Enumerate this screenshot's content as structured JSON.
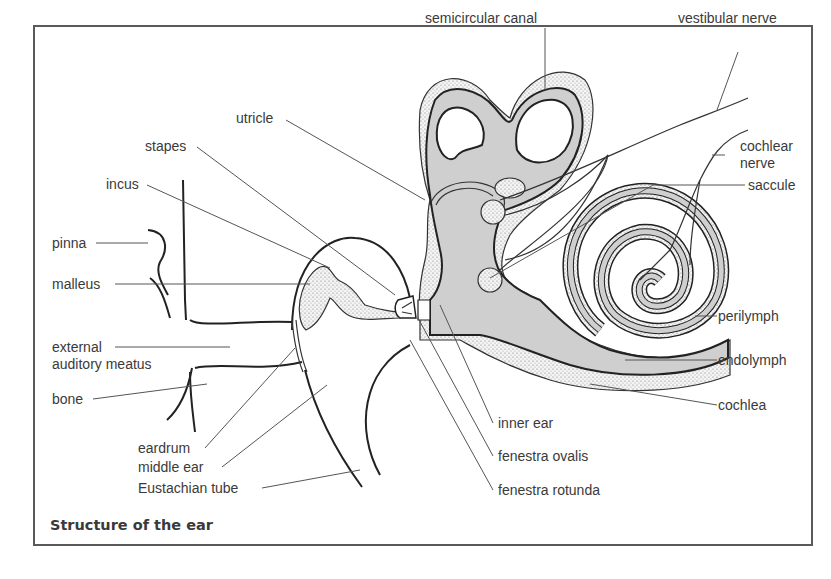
{
  "figure": {
    "title": "Structure of the ear",
    "labels": {
      "semicircular_canal": "semicircular canal",
      "vestibular_nerve": "vestibular nerve",
      "utricle": "utricle",
      "stapes": "stapes",
      "incus": "incus",
      "cochlear_nerve_line1": "cochlear",
      "cochlear_nerve_line2": "nerve",
      "saccule": "saccule",
      "pinna": "pinna",
      "malleus": "malleus",
      "external_line1": "external",
      "external_line2": "auditory meatus",
      "bone": "bone",
      "perilymph": "perilymph",
      "endolymph": "endolymph",
      "cochlea": "cochlea",
      "eardrum": "eardrum",
      "middle_ear": "middle ear",
      "eustachian_tube": "Eustachian tube",
      "inner_ear": "inner ear",
      "fenestra_ovalis": "fenestra ovalis",
      "fenestra_rotunda": "fenestra rotunda"
    },
    "colors": {
      "fluid_fill": "#cfcfcf",
      "outline": "#222222",
      "text": "#3a3a3a",
      "frame": "#5a5a5a"
    }
  }
}
